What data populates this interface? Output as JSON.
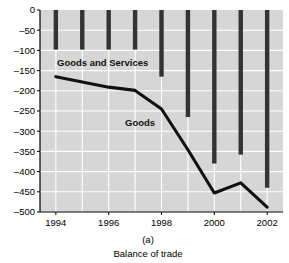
{
  "figure": {
    "panel_label": "(a)",
    "caption": "Balance of trade"
  },
  "chart_data": {
    "type": "bar",
    "title": "",
    "subtitle": "",
    "xlabel": "",
    "ylabel": "",
    "categories": [
      1994,
      1995,
      1996,
      1997,
      1998,
      1999,
      2000,
      2001,
      2002
    ],
    "xtick_labels": [
      "1994",
      "1996",
      "1998",
      "2000",
      "2002"
    ],
    "xticks": [
      1994,
      1996,
      1998,
      2000,
      2002
    ],
    "ytick_labels": [
      "0",
      "-50",
      "-100",
      "-150",
      "-200",
      "-250",
      "-300",
      "-350",
      "-400",
      "-450",
      "-500"
    ],
    "yticks": [
      0,
      -50,
      -100,
      -150,
      -200,
      -250,
      -300,
      -350,
      -400,
      -450,
      -500
    ],
    "ylim": [
      -500,
      0
    ],
    "xlim": [
      1993.4,
      2002.6
    ],
    "grid": true,
    "legend_position": "inline-annotations",
    "series": [
      {
        "name": "Goods and Services",
        "type": "bar",
        "label_text": "Goods and Services",
        "color": "#333333",
        "values": [
          -98,
          -98,
          -98,
          -98,
          -165,
          -265,
          -380,
          -358,
          -440
        ]
      },
      {
        "name": "Goods",
        "type": "line",
        "label_text": "Goods",
        "color": "#111111",
        "values": [
          -165,
          -178,
          -191,
          -199,
          -245,
          -346,
          -453,
          -428,
          -488
        ]
      }
    ],
    "plot_background": "#d6d6d6",
    "gridline_color": "#ffffff",
    "axis_color": "#000000"
  }
}
